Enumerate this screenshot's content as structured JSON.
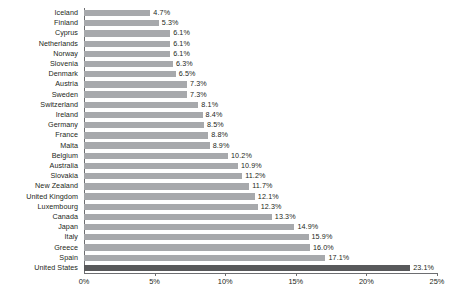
{
  "chart_data": {
    "type": "bar",
    "orientation": "horizontal",
    "title": "",
    "subtitle": "",
    "xlabel": "",
    "ylabel": "",
    "xlim": [
      0,
      25
    ],
    "grid": false,
    "legend": null,
    "value_suffix": "%",
    "axis": {
      "ticks": [
        0,
        5,
        10,
        15,
        20,
        25
      ],
      "tick_labels": [
        "0%",
        "5%",
        "10%",
        "15%",
        "20%",
        "25%"
      ]
    },
    "colors": {
      "bar": "#a7a9ac",
      "bar_highlight": "#58595b",
      "axis": "#6d6e71",
      "text": "#231f20",
      "background": "#ffffff"
    },
    "highlight_category": "United States",
    "categories": [
      "Iceland",
      "Finland",
      "Cyprus",
      "Netherlands",
      "Norway",
      "Slovenia",
      "Denmark",
      "Austria",
      "Sweden",
      "Switzerland",
      "Ireland",
      "Germany",
      "France",
      "Malta",
      "Belgium",
      "Australia",
      "Slovakia",
      "New Zealand",
      "United Kingdom",
      "Luxembourg",
      "Canada",
      "Japan",
      "Italy",
      "Greece",
      "Spain",
      "United States"
    ],
    "values": [
      4.7,
      5.3,
      6.1,
      6.1,
      6.1,
      6.3,
      6.5,
      7.3,
      7.3,
      8.1,
      8.4,
      8.5,
      8.8,
      8.9,
      10.2,
      10.9,
      11.2,
      11.7,
      12.1,
      12.3,
      13.3,
      14.9,
      15.9,
      16.0,
      17.1,
      23.1
    ],
    "value_labels": [
      "4.7%",
      "5.3%",
      "6.1%",
      "6.1%",
      "6.1%",
      "6.3%",
      "6.5%",
      "7.3%",
      "7.3%",
      "8.1%",
      "8.4%",
      "8.5%",
      "8.8%",
      "8.9%",
      "10.2%",
      "10.9%",
      "11.2%",
      "11.7%",
      "12.1%",
      "12.3%",
      "13.3%",
      "14.9%",
      "15.9%",
      "16.0%",
      "17.1%",
      "23.1%"
    ]
  }
}
